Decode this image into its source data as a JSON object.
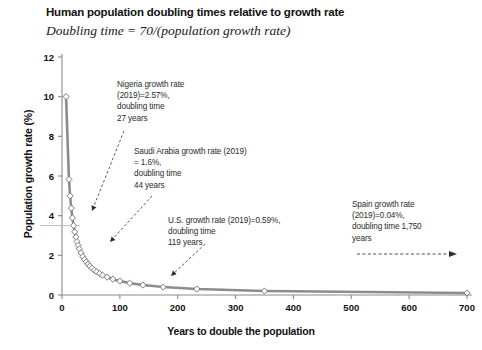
{
  "chart_data": {
    "type": "line",
    "title": "Human population doubling times relative to growth rate",
    "subtitle": "Doubling time = 70/(population growth rate)",
    "xlabel": "Years to double the population",
    "ylabel": "Population growth rate (%)",
    "xlim": [
      0,
      700
    ],
    "ylim": [
      0,
      12
    ],
    "xticks": [
      0,
      100,
      200,
      300,
      400,
      500,
      600,
      700
    ],
    "yticks": [
      0,
      2,
      4,
      6,
      8,
      10,
      12
    ],
    "grid": false,
    "legend": "none",
    "marker": "diamond",
    "line_color": "#8c8c8c",
    "marker_edge_color": "#6e6e6e",
    "marker_face_color": "#ffffff",
    "formula": "y = 70 / x",
    "series": [
      {
        "name": "Doubling time curve",
        "x": [
          7,
          12,
          14,
          16,
          18,
          20,
          22,
          24,
          26,
          28,
          30,
          33,
          36,
          39,
          42,
          45,
          48,
          52,
          56,
          60,
          65,
          70,
          78,
          88,
          100,
          117,
          140,
          175,
          233,
          350,
          700
        ],
        "y": [
          10.0,
          5.83,
          5.0,
          4.38,
          3.89,
          3.5,
          3.18,
          2.92,
          2.69,
          2.5,
          2.33,
          2.12,
          1.94,
          1.79,
          1.67,
          1.56,
          1.46,
          1.35,
          1.25,
          1.17,
          1.08,
          1.0,
          0.9,
          0.8,
          0.7,
          0.6,
          0.5,
          0.4,
          0.3,
          0.2,
          0.1
        ]
      }
    ],
    "annotations": [
      {
        "id": "nigeria",
        "lines": [
          "Nigeria growth rate",
          "(2019)=2.57%,",
          "doubling time",
          "27 years"
        ],
        "text": "Nigeria growth rate\n(2019)=2.57%,\ndoubling time\n27 years",
        "country": "Nigeria",
        "year": 2019,
        "growth_rate_percent": 2.57,
        "doubling_time_years": 27,
        "point": [
          27,
          2.57
        ]
      },
      {
        "id": "saudi_arabia",
        "lines": [
          "Saudi Arabia growth rate (2019)",
          "= 1.6%,",
          "doubling time",
          "44 years"
        ],
        "text": "Saudi Arabia growth rate (2019)\n= 1.6%,\ndoubling time\n44 years",
        "country": "Saudi Arabia",
        "year": 2019,
        "growth_rate_percent": 1.6,
        "doubling_time_years": 44,
        "point": [
          44,
          1.6
        ]
      },
      {
        "id": "united_states",
        "lines": [
          "U.S. growth rate (2019)=0.59%,",
          "doubling time",
          "119 years"
        ],
        "text": "U.S. growth rate (2019)=0.59%,\ndoubling time\n119 years",
        "country": "U.S.",
        "year": 2019,
        "growth_rate_percent": 0.59,
        "doubling_time_years": 119,
        "point": [
          119,
          0.59
        ]
      },
      {
        "id": "spain",
        "lines": [
          "Spain growth rate",
          "(2019)=0.04%,",
          "doubling time 1,750",
          "years"
        ],
        "text": "Spain growth rate\n(2019)=0.04%,\ndoubling time 1,750\nyears",
        "country": "Spain",
        "year": 2019,
        "growth_rate_percent": 0.04,
        "doubling_time_years": 1750,
        "point": [
          1750,
          0.04
        ]
      }
    ]
  }
}
